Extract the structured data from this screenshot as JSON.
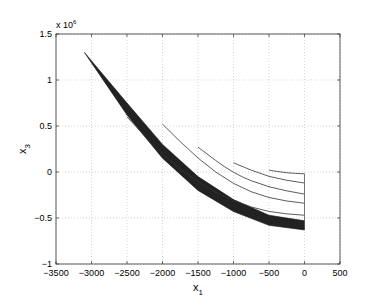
{
  "chart_data": {
    "type": "line",
    "title": "",
    "xlabel": "x1",
    "ylabel": "x3",
    "y_multiplier": "x 10^6",
    "xlim": [
      -3500,
      500
    ],
    "ylim": [
      -1,
      1.5
    ],
    "grid": true,
    "x_ticks": [
      "-3500",
      "-3000",
      "-2500",
      "-2000",
      "-1500",
      "-1000",
      "-500",
      "0",
      "500"
    ],
    "y_ticks": [
      "-1",
      "-0.5",
      "0",
      "0.5",
      "1",
      "1.5"
    ],
    "series": [
      {
        "name": "filled band (dense trajectories)",
        "style": "filled",
        "upper": [
          [
            -3100,
            1.3
          ],
          [
            -2500,
            0.75
          ],
          [
            -2000,
            0.3
          ],
          [
            -1500,
            -0.05
          ],
          [
            -1000,
            -0.3
          ],
          [
            -500,
            -0.47
          ],
          [
            0,
            -0.53
          ]
        ],
        "lower": [
          [
            -3100,
            1.3
          ],
          [
            -2500,
            0.62
          ],
          [
            -2000,
            0.15
          ],
          [
            -1500,
            -0.2
          ],
          [
            -1000,
            -0.43
          ],
          [
            -500,
            -0.58
          ],
          [
            0,
            -0.63
          ]
        ]
      },
      {
        "name": "trajectory 1",
        "points": [
          [
            -2500,
            0.6
          ],
          [
            -2000,
            0.18
          ],
          [
            -1500,
            -0.12
          ],
          [
            -1000,
            -0.32
          ],
          [
            -500,
            -0.44
          ],
          [
            0,
            -0.47
          ]
        ]
      },
      {
        "name": "trajectory 2",
        "points": [
          [
            -2000,
            0.52
          ],
          [
            -1500,
            0.14
          ],
          [
            -1000,
            -0.14
          ],
          [
            -500,
            -0.29
          ],
          [
            0,
            -0.34
          ]
        ]
      },
      {
        "name": "trajectory 3",
        "points": [
          [
            -1500,
            0.27
          ],
          [
            -1000,
            -0.02
          ],
          [
            -500,
            -0.17
          ],
          [
            0,
            -0.24
          ]
        ]
      },
      {
        "name": "trajectory 4",
        "points": [
          [
            -1000,
            0.1
          ],
          [
            -500,
            -0.06
          ],
          [
            0,
            -0.12
          ]
        ]
      },
      {
        "name": "trajectory 5",
        "points": [
          [
            -500,
            0.02
          ],
          [
            -250,
            -0.01
          ],
          [
            0,
            -0.02
          ]
        ]
      }
    ]
  },
  "axes": {
    "xlabel_main": "x",
    "xlabel_sub": "1",
    "ylabel_main": "x",
    "ylabel_sub": "3",
    "multiplier_base": "x 10",
    "multiplier_exp": "6"
  }
}
